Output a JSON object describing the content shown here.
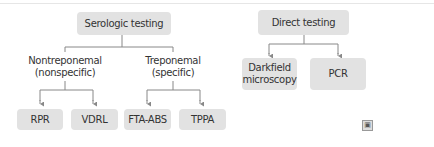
{
  "diagram": {
    "groups": [
      {
        "title": "Serologic testing",
        "children": [
          {
            "label_line1": "Nontreponemal",
            "label_line2": "(nonspecific)",
            "leaves": [
              "RPR",
              "VDRL"
            ]
          },
          {
            "label_line1": "Treponemal",
            "label_line2": "(specific)",
            "leaves": [
              "FTA-ABS",
              "TPPA"
            ]
          }
        ]
      },
      {
        "title": "Direct testing",
        "leaves": [
          {
            "line1": "Darkfield",
            "line2": "microscopy"
          },
          {
            "line1": "PCR",
            "line2": ""
          }
        ]
      }
    ],
    "corner_icon": "image-icon",
    "colors": {
      "box_fill": "#e2e2e2",
      "line": "#888888",
      "text": "#333333"
    }
  }
}
